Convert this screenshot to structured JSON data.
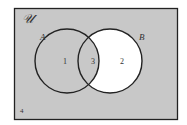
{
  "diagram": {
    "type": "venn",
    "universe_label": "𝒰",
    "sets": [
      {
        "name": "A",
        "label": "A"
      },
      {
        "name": "B",
        "label": "B"
      }
    ],
    "regions": [
      {
        "id": "1",
        "label": "1",
        "description": "A only",
        "shaded": true
      },
      {
        "id": "2",
        "label": "2",
        "description": "B only",
        "shaded": false
      },
      {
        "id": "3",
        "label": "3",
        "description": "A and B",
        "shaded": true
      },
      {
        "id": "4",
        "label": "4",
        "description": "outside A and B",
        "shaded": true
      }
    ],
    "colors": {
      "shade": "#c8c8c8",
      "unshaded": "#ffffff",
      "stroke": "#222222"
    }
  }
}
